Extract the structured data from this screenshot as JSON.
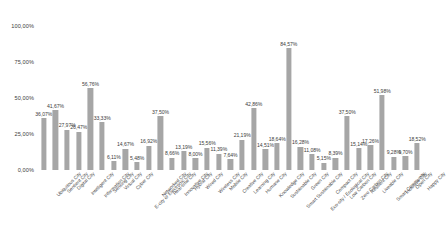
{
  "chart_data": {
    "type": "bar",
    "title": "",
    "subtitle": "",
    "xlabel": "",
    "ylabel": "",
    "ylim": [
      0,
      100
    ],
    "grid": false,
    "legend": null,
    "y_tick_labels": [
      "0,00%",
      "25,00%",
      "50,00%",
      "75,00%",
      "100,00%"
    ],
    "y_ticks": [
      0,
      25,
      50,
      75,
      100
    ],
    "value_label_suffix": "%",
    "decimal_separator": ",",
    "bar_color": "#a6a6a6",
    "categories": [
      "Ubiquitous City",
      "Sentient City",
      "Digital City",
      "Intelligent City",
      "Information City",
      "Sensing City",
      "Virtual City",
      "Cyber City",
      "E-city or Electronic City",
      "Networked City",
      "Real-time City",
      "Innovative City",
      "Hybrid City",
      "Wired City",
      "Wireless City",
      "Mobile City",
      "Creative City",
      "Learning City",
      "Humane City",
      "Knowledge City",
      "Sustainable City",
      "Smart Sustainable City",
      "Green City",
      "Eco-city / Ecological City",
      "Compact City",
      "Low Carbon City",
      "Zero Carbon City",
      "Resilient City",
      "Liveable City",
      "Smart Community",
      "Inclusive City",
      "Open City",
      "Happy City"
    ],
    "values": [
      36.07,
      41.67,
      27.97,
      26.47,
      56.76,
      33.33,
      6.11,
      14.67,
      5.48,
      16.92,
      37.5,
      8.66,
      13.19,
      8.0,
      15.56,
      11.39,
      7.64,
      21.19,
      42.86,
      14.51,
      18.64,
      84.57,
      16.28,
      11.08,
      5.15,
      8.39,
      37.5,
      15.14,
      17.26,
      51.98,
      9.28,
      9.7,
      18.52
    ],
    "value_labels": [
      "36,07%",
      "41,67%",
      "27,97%",
      "26,47%",
      "56,76%",
      "33,33%",
      "6,11%",
      "14,67%",
      "5,48%",
      "16,92%",
      "37,50%",
      "8,66%",
      "13,19%",
      "8,00%",
      "15,56%",
      "11,39%",
      "7,64%",
      "21,19%",
      "42,86%",
      "14,51%",
      "18,64%",
      "84,57%",
      "16,28%",
      "11,08%",
      "5,15%",
      "8,39%",
      "37,50%",
      "15,14%",
      "17,26%",
      "51,98%",
      "9,28%",
      "9,70%",
      "18,52%"
    ]
  }
}
